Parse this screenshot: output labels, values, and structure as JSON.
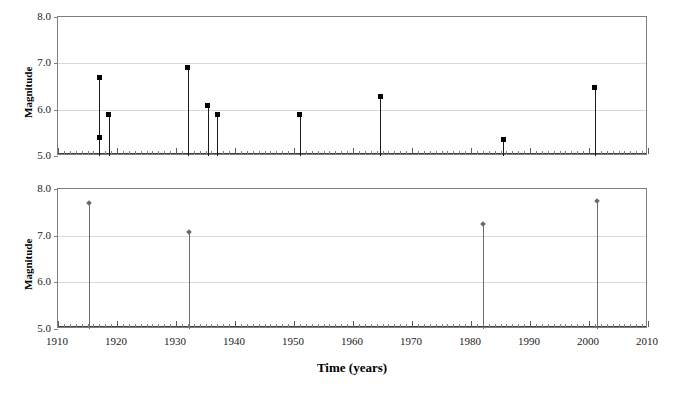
{
  "figure": {
    "background": "#ffffff",
    "axis_title_x": "Time (years)",
    "axis_title_y": "Magnitude"
  },
  "chart_data": [
    {
      "type": "scatter",
      "title": "Volcanic Chain",
      "xlabel": "Time (years)",
      "ylabel": "Magnitude",
      "xlim": [
        1910,
        2010
      ],
      "ylim": [
        5.0,
        8.0
      ],
      "xticks": [
        1910,
        1920,
        1930,
        1940,
        1950,
        1960,
        1970,
        1980,
        1990,
        2000,
        2010
      ],
      "xticklabels": [
        "1910",
        "1920",
        "1930",
        "1940",
        "1950",
        "1960",
        "1970",
        "1980",
        "1990",
        "2000",
        "2010"
      ],
      "yticks": [
        5.0,
        6.0,
        7.0,
        8.0
      ],
      "yticklabels": [
        "5.0",
        "6.0",
        "7.0",
        "8.0"
      ],
      "grid": "horizontal",
      "legend": "none",
      "marker": "filled-square",
      "marker_color": "#000000",
      "stem_color": "#1a1a1a",
      "points": [
        {
          "x": 1917.0,
          "y": 6.7
        },
        {
          "x": 1917.0,
          "y": 5.4
        },
        {
          "x": 1918.6,
          "y": 5.9
        },
        {
          "x": 1932.0,
          "y": 6.9
        },
        {
          "x": 1935.4,
          "y": 6.1
        },
        {
          "x": 1937.0,
          "y": 5.9
        },
        {
          "x": 1951.0,
          "y": 5.9
        },
        {
          "x": 1964.6,
          "y": 6.28
        },
        {
          "x": 1985.5,
          "y": 5.35
        },
        {
          "x": 2001.0,
          "y": 6.47
        }
      ]
    },
    {
      "type": "scatter",
      "title": "Subduction",
      "xlabel": "Time (years)",
      "ylabel": "Magnitude",
      "xlim": [
        1910,
        2010
      ],
      "ylim": [
        5.0,
        8.0
      ],
      "xticks": [
        1910,
        1920,
        1930,
        1940,
        1950,
        1960,
        1970,
        1980,
        1990,
        2000,
        2010
      ],
      "xticklabels": [
        "1910",
        "1920",
        "1930",
        "1940",
        "1950",
        "1960",
        "1970",
        "1980",
        "1990",
        "2000",
        "2010"
      ],
      "yticks": [
        5.0,
        6.0,
        7.0,
        8.0
      ],
      "yticklabels": [
        "5.0",
        "6.0",
        "7.0",
        "8.0"
      ],
      "grid": "horizontal",
      "legend": "none",
      "marker": "filled-diamond",
      "marker_color": "#6a6a6a",
      "stem_color": "#6e6e6e",
      "points": [
        {
          "x": 1915.3,
          "y": 7.7
        },
        {
          "x": 1932.2,
          "y": 7.08
        },
        {
          "x": 1982.0,
          "y": 7.25
        },
        {
          "x": 2001.3,
          "y": 7.75
        }
      ]
    }
  ]
}
